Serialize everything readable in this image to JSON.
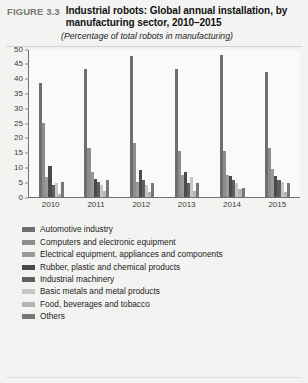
{
  "figure": {
    "number": "FIGURE 3.3",
    "title": "Industrial robots: Global annual installation, by manufacturing sector, 2010–2015",
    "subtitle": "(Percentage of total robots in manufacturing)"
  },
  "chart_data": {
    "type": "bar",
    "title": "Industrial robots: Global annual installation, by manufacturing sector, 2010–2015",
    "subtitle": "(Percentage of total robots in manufacturing)",
    "xlabel": "",
    "ylabel": "",
    "ylim": [
      0,
      50
    ],
    "yticks": [
      0,
      5,
      10,
      15,
      20,
      25,
      30,
      35,
      40,
      45,
      50
    ],
    "grid": false,
    "legend_position": "bottom",
    "categories": [
      "2010",
      "2011",
      "2012",
      "2013",
      "2014",
      "2015"
    ],
    "series": [
      {
        "name": "Automotive industry",
        "color": "#6e6e6e",
        "values": [
          38.5,
          43.0,
          47.5,
          43.0,
          48.0,
          42.0
        ]
      },
      {
        "name": "Computers and electronic equipment",
        "color": "#8d8d8d",
        "values": [
          25.0,
          16.5,
          18.0,
          15.5,
          15.5,
          16.5
        ]
      },
      {
        "name": "Electrical equipment, appliances and components",
        "color": "#9a9a9a",
        "values": [
          6.5,
          8.5,
          5.0,
          7.5,
          7.5,
          9.5
        ]
      },
      {
        "name": "Rubber, plastic and chemical products",
        "color": "#4a4a4a",
        "values": [
          10.5,
          6.0,
          9.0,
          8.5,
          7.0,
          7.0
        ]
      },
      {
        "name": "Industrial machinery",
        "color": "#5e5e5e",
        "values": [
          4.0,
          5.0,
          5.5,
          4.5,
          5.5,
          5.5
        ]
      },
      {
        "name": "Basic metals and metal products",
        "color": "#c6c6c6",
        "values": [
          4.5,
          4.0,
          4.0,
          6.5,
          4.5,
          5.0
        ]
      },
      {
        "name": "Food, beverages and tobacco",
        "color": "#b4b4b4",
        "values": [
          1.0,
          2.0,
          1.5,
          2.0,
          2.5,
          1.5
        ]
      },
      {
        "name": "Others",
        "color": "#787878",
        "values": [
          5.0,
          5.5,
          4.5,
          4.5,
          3.0,
          4.5
        ]
      }
    ]
  }
}
